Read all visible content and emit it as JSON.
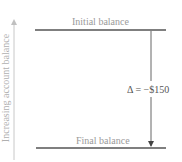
{
  "diagram": {
    "axis_label": "Increasing account balance",
    "levels": [
      {
        "name": "initial",
        "label": "Initial balance"
      },
      {
        "name": "final",
        "label": "Final balance"
      }
    ],
    "change_label": "Δ = −$150",
    "colors": {
      "level_line": "#555555",
      "arrow": "#555555",
      "axis_arrow": "#c8c8c8",
      "label_text": "#9a9a9a"
    }
  }
}
